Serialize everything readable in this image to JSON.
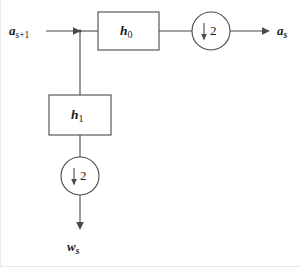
{
  "figure": {
    "type": "block-diagram",
    "background_color": "#ffffff",
    "line_color": "#4a4a4a",
    "text_color": "#1a1a1a"
  },
  "signals": {
    "input": {
      "base": "a",
      "subscript": "s+1",
      "full": "a_{s+1}"
    },
    "output_top": {
      "base": "a",
      "subscript": "s",
      "full": "a_s"
    },
    "output_bottom": {
      "base": "w",
      "subscript": "s",
      "full": "w_s"
    }
  },
  "blocks": [
    {
      "id": "h0",
      "base": "h",
      "subscript": "0",
      "full": "h_0",
      "role": "lowpass-filter"
    },
    {
      "id": "h1",
      "base": "h",
      "subscript": "1",
      "full": "h_1",
      "role": "highpass-filter"
    }
  ],
  "downsamplers": [
    {
      "id": "downsampler-top",
      "arrow": "↓",
      "factor": "2",
      "full": "↓2"
    },
    {
      "id": "downsampler-bottom",
      "arrow": "↓",
      "factor": "2",
      "full": "↓2"
    }
  ]
}
